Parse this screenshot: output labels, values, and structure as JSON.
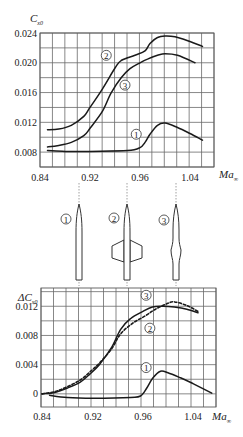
{
  "chart_data": [
    {
      "type": "line",
      "name": "cx0-vs-mach",
      "ylabel_main": "C",
      "ylabel_sub": "x0",
      "xlabel_main": "Ma",
      "xlabel_sub": "∞",
      "x_ticks": [
        0.84,
        0.92,
        0.96,
        1.04
      ],
      "x_tick_labels": [
        "0.84",
        "0.92",
        "0.96",
        "1.04"
      ],
      "y_ticks": [
        0.008,
        0.012,
        0.016,
        0.02,
        0.024
      ],
      "y_tick_labels": [
        "0.008",
        "0.012",
        "0.016",
        "0.020",
        "0.024"
      ],
      "ylim": [
        0.006,
        0.024
      ],
      "xlim": [
        0.84,
        1.088
      ],
      "grid": true,
      "series": [
        {
          "name": "1",
          "style": "solid",
          "label_at": [
            0.957,
            0.0104
          ],
          "x": [
            0.852,
            0.88,
            0.92,
            0.95,
            0.96,
            0.968,
            0.976,
            0.988,
            1.0,
            1.02,
            1.04,
            1.06
          ],
          "y": [
            0.0082,
            0.0081,
            0.0081,
            0.0082,
            0.0086,
            0.0093,
            0.0104,
            0.0116,
            0.0119,
            0.0113,
            0.0105,
            0.0096
          ]
        },
        {
          "name": "2",
          "style": "solid",
          "label_at": [
            0.933,
            0.021
          ],
          "x": [
            0.852,
            0.87,
            0.89,
            0.91,
            0.92,
            0.93,
            0.94,
            0.945,
            0.956,
            0.968,
            0.976,
            0.988,
            1.0,
            1.016,
            1.032,
            1.06
          ],
          "y": [
            0.011,
            0.0111,
            0.0116,
            0.0128,
            0.014,
            0.0165,
            0.0193,
            0.0203,
            0.021,
            0.0216,
            0.0226,
            0.0234,
            0.0236,
            0.0235,
            0.0231,
            0.0222
          ]
        },
        {
          "name": "3",
          "style": "solid",
          "label_at": [
            0.948,
            0.017
          ],
          "x": [
            0.852,
            0.87,
            0.89,
            0.91,
            0.92,
            0.93,
            0.937,
            0.945,
            0.952,
            0.96,
            0.972,
            0.988,
            1.0,
            1.02,
            1.048
          ],
          "y": [
            0.0087,
            0.0089,
            0.0093,
            0.0102,
            0.0112,
            0.0135,
            0.016,
            0.018,
            0.0192,
            0.02,
            0.0205,
            0.021,
            0.0212,
            0.021,
            0.02
          ]
        }
      ]
    },
    {
      "type": "line",
      "name": "delta-cx0-vs-mach",
      "ylabel_prefix": "Δ",
      "ylabel_main": "C",
      "ylabel_sub": "x0",
      "xlabel_main": "Ma",
      "xlabel_sub": "∞",
      "x_ticks": [
        0.84,
        0.92,
        0.96,
        1.04
      ],
      "x_tick_labels": [
        "0.84",
        "0.92",
        "0.96",
        "1.04"
      ],
      "y_ticks": [
        0,
        0.004,
        0.008,
        0.012
      ],
      "y_tick_labels": [
        "0",
        "0.004",
        "0.008",
        "0.012"
      ],
      "ylim": [
        -0.0018,
        0.0145
      ],
      "xlim": [
        0.84,
        1.088
      ],
      "grid": true,
      "series": [
        {
          "name": "1",
          "style": "solid",
          "label_at": [
            0.965,
            0.0036
          ],
          "x": [
            0.852,
            0.88,
            0.92,
            0.95,
            0.958,
            0.966,
            0.976,
            0.988,
            1.0,
            1.02,
            1.04,
            1.07
          ],
          "y": [
            -0.0002,
            -0.0005,
            -0.0006,
            -0.0005,
            -0.0003,
            0.0008,
            0.0022,
            0.0031,
            0.0029,
            0.0022,
            0.0014,
            0.0001
          ]
        },
        {
          "name": "2",
          "style": "dashed",
          "label_at": [
            0.971,
            0.009
          ],
          "x": [
            0.84,
            0.86,
            0.88,
            0.9,
            0.915,
            0.925,
            0.935,
            0.942,
            0.952,
            0.964,
            0.98,
            1.0,
            1.01,
            1.03,
            1.048
          ],
          "y": [
            0.0,
            0.0003,
            0.001,
            0.0019,
            0.003,
            0.0042,
            0.0062,
            0.0082,
            0.0097,
            0.0107,
            0.0116,
            0.0124,
            0.0126,
            0.0121,
            0.0113
          ]
        },
        {
          "name": "3",
          "style": "solid",
          "label_at": [
            0.965,
            0.0135
          ],
          "x": [
            0.84,
            0.86,
            0.88,
            0.9,
            0.915,
            0.925,
            0.935,
            0.942,
            0.95,
            0.96,
            0.975,
            0.992,
            1.01,
            1.03,
            1.048
          ],
          "y": [
            0.0,
            0.0002,
            0.0008,
            0.0016,
            0.0027,
            0.004,
            0.0064,
            0.0088,
            0.0103,
            0.0113,
            0.0119,
            0.012,
            0.0119,
            0.0116,
            0.0111
          ]
        }
      ]
    }
  ],
  "configurations": [
    {
      "label": "1",
      "shape": "slender-body"
    },
    {
      "label": "2",
      "shape": "body-with-wing"
    },
    {
      "label": "3",
      "shape": "area-ruled-body"
    }
  ]
}
